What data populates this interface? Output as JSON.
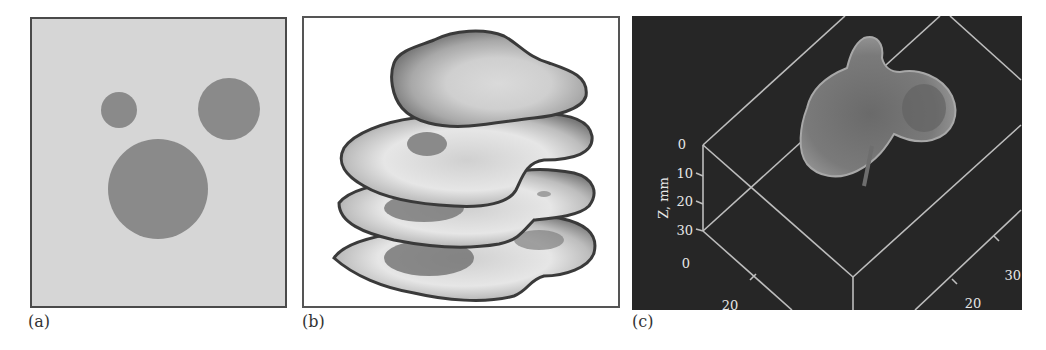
{
  "figure": {
    "panels": [
      {
        "id": "a",
        "caption": "(a)",
        "description": "Phantom: three dark circular inclusions on a light gray background",
        "background_color": "#d6d6d6",
        "inclusion_color": "#8a8a8a",
        "circles": [
          {
            "cx": 89,
            "cy": 93,
            "r": 18
          },
          {
            "cx": 199,
            "cy": 92,
            "r": 31
          },
          {
            "cx": 128,
            "cy": 172,
            "r": 50
          }
        ]
      },
      {
        "id": "b",
        "caption": "(b)",
        "description": "Stack of four reconstructed slice layers with grayscale contour shading"
      },
      {
        "id": "c",
        "caption": "(c)",
        "description": "3D rendering of reconstructed object with wireframe axes",
        "z_axis_label": "Z, mm",
        "z_ticks": [
          "0",
          "10",
          "20",
          "30"
        ],
        "x_ticks": [
          "0",
          "20"
        ],
        "y_ticks": [
          "30",
          "20"
        ]
      }
    ]
  }
}
